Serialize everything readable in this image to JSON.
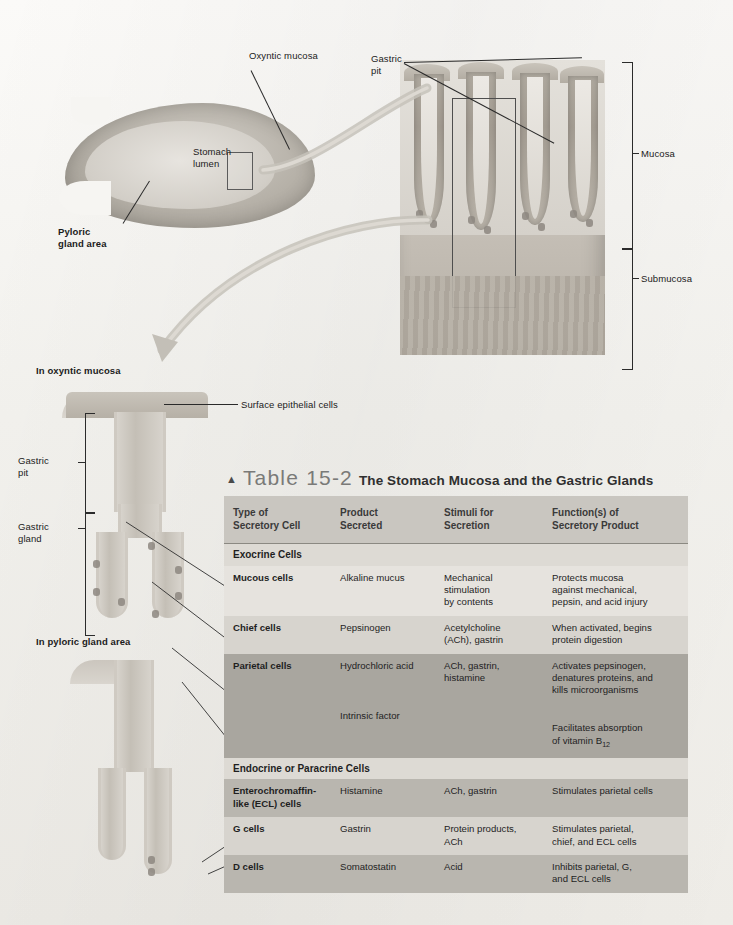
{
  "figure": {
    "labels": [
      {
        "id": "oxyntic-mucosa",
        "text": "Oxyntic mucosa"
      },
      {
        "id": "stomach-lumen",
        "text": "Stomach\nlumen"
      },
      {
        "id": "pyloric-gland-area",
        "text": "Pyloric\ngland area"
      },
      {
        "id": "gastric-pit-top",
        "text": "Gastric\npit"
      },
      {
        "id": "mucosa",
        "text": "Mucosa"
      },
      {
        "id": "submucosa",
        "text": "Submucosa"
      },
      {
        "id": "in-oxyntic-mucosa",
        "text": "In oxyntic mucosa"
      },
      {
        "id": "surface-epithelial-cells",
        "text": "Surface epithelial cells"
      },
      {
        "id": "gastric-pit",
        "text": "Gastric\npit"
      },
      {
        "id": "gastric-gland",
        "text": "Gastric\ngland"
      },
      {
        "id": "in-pyloric-gland-area",
        "text": "In pyloric gland area"
      }
    ]
  },
  "table": {
    "marker": "▲",
    "number": "Table 15-2",
    "title": "The Stomach Mucosa and the Gastric Glands",
    "headers": [
      "Type of\nSecretory Cell",
      "Product\nSecreted",
      "Stimuli for\nSecretion",
      "Function(s) of\nSecretory Product"
    ],
    "sections": [
      {
        "heading": "Exocrine Cells",
        "rows": [
          {
            "cell": "Mucous cells",
            "product": "Alkaline mucus",
            "stimuli": "Mechanical\nstimulation\nby contents",
            "function": "Protects mucosa\nagainst mechanical,\npepsin, and acid injury"
          },
          {
            "cell": "Chief cells",
            "product": "Pepsinogen",
            "stimuli": "Acetylcholine\n(ACh), gastrin",
            "function": "When activated, begins\nprotein digestion"
          },
          {
            "cell": "Parietal cells",
            "product": "Hydrochloric acid",
            "stimuli": "ACh, gastrin,\nhistamine",
            "function": "Activates pepsinogen,\ndenatures proteins, and\nkills microorganisms"
          },
          {
            "cell": "",
            "product": "Intrinsic factor",
            "stimuli": "",
            "function_pre": "Facilitates absorption\nof vitamin B",
            "function_sub": "12"
          }
        ]
      },
      {
        "heading": "Endocrine or Paracrine Cells",
        "rows": [
          {
            "cell": "Enterochromaffin-\nlike (ECL) cells",
            "product": "Histamine",
            "stimuli": "ACh, gastrin",
            "function": "Stimulates parietal cells"
          },
          {
            "cell": "G cells",
            "product": "Gastrin",
            "stimuli": "Protein products,\nACh",
            "function": "Stimulates parietal,\nchief, and ECL cells"
          },
          {
            "cell": "D cells",
            "product": "Somatostatin",
            "stimuli": "Acid",
            "function": "Inhibits parietal, G,\nand ECL cells"
          }
        ]
      }
    ]
  },
  "colors": {
    "page": "#f4f3f0",
    "header_band": "#c9c6c0",
    "row_light": "#e6e3de",
    "row_mid": "#d7d4ce",
    "row_dark": "#a9a69f",
    "ink": "#1f1f1f"
  }
}
